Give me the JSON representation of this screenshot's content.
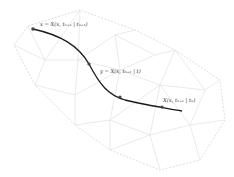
{
  "diagram": {
    "labels": {
      "start": "x = X(x, tₙ₊₁ | tₙ₊₁)",
      "middle": "y = X(x, tₙ₊₁ | t)",
      "end": "X(x, tₙ₊₁ | tₙ)"
    },
    "colors": {
      "curve": "#1a1a1a",
      "mesh": "#dcdcdc",
      "points": "#444444"
    },
    "points": [
      {
        "name": "start",
        "x": 33,
        "y": 29
      },
      {
        "name": "middle",
        "x": 89,
        "y": 64
      },
      {
        "name": "mid2",
        "x": 120,
        "y": 97
      },
      {
        "name": "end",
        "x": 162,
        "y": 107
      }
    ]
  }
}
